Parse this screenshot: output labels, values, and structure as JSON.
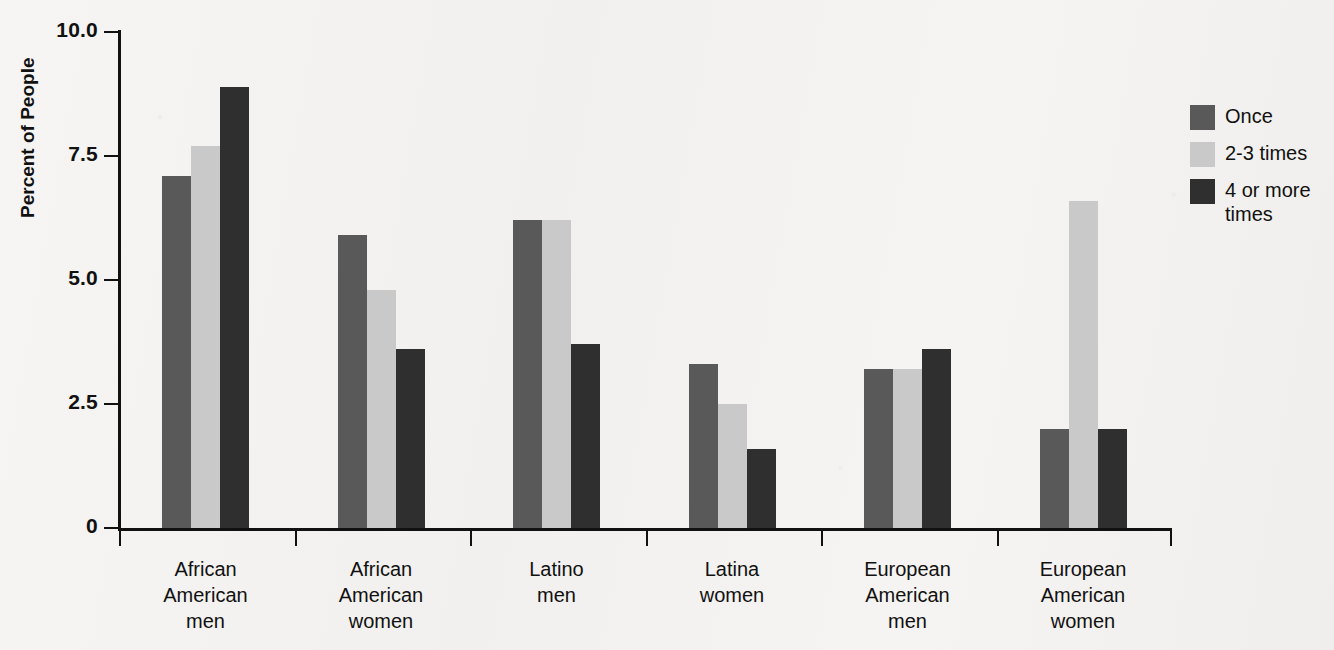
{
  "chart_data": {
    "type": "bar",
    "title": "",
    "xlabel": "",
    "ylabel": "Percent of People",
    "ylim": [
      0,
      10.0
    ],
    "ytick_labels": [
      "10.0",
      "7.5",
      "5.0",
      "2.5",
      "0"
    ],
    "ytick_values": [
      10.0,
      7.5,
      5.0,
      2.5,
      0
    ],
    "grid": false,
    "legend_position": "right",
    "categories": [
      "African\nAmerican\nmen",
      "African\nAmerican\nwomen",
      "Latino\nmen",
      "Latina\nwomen",
      "European\nAmerican\nmen",
      "European\nAmerican\nwomen"
    ],
    "category_lines": [
      [
        "African",
        "American",
        "men"
      ],
      [
        "African",
        "American",
        "women"
      ],
      [
        "Latino",
        "men"
      ],
      [
        "Latina",
        "women"
      ],
      [
        "European",
        "American",
        "men"
      ],
      [
        "European",
        "American",
        "women"
      ]
    ],
    "series": [
      {
        "name": "Once",
        "key": "once",
        "color": "#595959",
        "values": [
          7.1,
          5.9,
          6.2,
          3.3,
          3.2,
          2.0
        ]
      },
      {
        "name": "2-3 times",
        "key": "two_three",
        "color": "#c9c9c9",
        "values": [
          7.7,
          4.8,
          6.2,
          2.5,
          3.2,
          6.6
        ]
      },
      {
        "name": "4 or more times",
        "key": "four_plus",
        "color": "#2f2f2f",
        "values": [
          8.9,
          3.6,
          3.7,
          1.6,
          3.6,
          2.0
        ]
      }
    ],
    "legend": [
      {
        "label": "Once",
        "key": "once",
        "color": "#595959"
      },
      {
        "label": "2-3 times",
        "key": "two_three",
        "color": "#c9c9c9"
      },
      {
        "label": "4 or more times",
        "key": "four_plus",
        "color": "#2f2f2f"
      }
    ]
  },
  "colors": {
    "background": "#f4f3f1",
    "axis": "#111111",
    "text": "#111111",
    "series_once": "#595959",
    "series_two_three": "#c9c9c9",
    "series_four_plus": "#2f2f2f"
  }
}
